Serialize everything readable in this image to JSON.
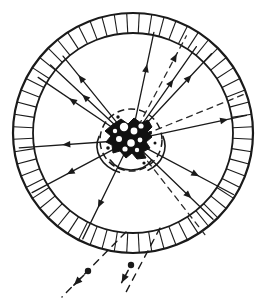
{
  "figure": {
    "name": "radial-emission-ring-diagram",
    "type": "scientific-line-diagram",
    "caption": "",
    "background_color": "#ffffff",
    "ink_color": "#1a1a1a",
    "width": 269,
    "height": 308
  },
  "ring": {
    "label": "hatched-annulus",
    "center_x": 133,
    "center_y": 133,
    "outer_radius": 120,
    "inner_radius": 100,
    "tick_count": 60,
    "stroke_width_outer": 2.2,
    "stroke_width_inner": 1.8,
    "tick_stroke_width": 1.1
  },
  "core": {
    "label": "central-dark-body",
    "center_x": 131,
    "center_y": 140,
    "fill_color": "#111111",
    "outline_radius": 31,
    "outline_dash": "7 4"
  },
  "rays": {
    "solid_label": "solid-ray",
    "dashed_label": "dashed-ray",
    "solid_color": "#1a1a1a",
    "dashed_color": "#2a2a2a",
    "solid_width": 1.3,
    "dashed_width": 1.3,
    "dash_pattern": "6 5",
    "solid": [
      {
        "id": "ray-nw-1",
        "angle_deg": 214,
        "length": 112,
        "head_at": 0.62
      },
      {
        "id": "ray-nw-2",
        "angle_deg": 223,
        "length": 110,
        "head_at": 0.55
      },
      {
        "id": "ray-nw-3",
        "angle_deg": 231,
        "length": 108,
        "head_at": 0.74
      },
      {
        "id": "ray-n-1",
        "angle_deg": 282,
        "length": 110,
        "head_at": 0.66
      },
      {
        "id": "ray-ne-1",
        "angle_deg": 305,
        "length": 114,
        "head_at": 0.6
      },
      {
        "id": "ray-ne-2",
        "angle_deg": 313,
        "length": 118,
        "head_at": 0.72
      },
      {
        "id": "ray-e-1",
        "angle_deg": 348,
        "length": 118,
        "head_at": 0.82
      },
      {
        "id": "ray-w-1",
        "angle_deg": 176,
        "length": 112,
        "head_at": 0.56
      },
      {
        "id": "ray-sw-1",
        "angle_deg": 152,
        "length": 112,
        "head_at": 0.6
      },
      {
        "id": "ray-sw-2",
        "angle_deg": 116,
        "length": 110,
        "head_at": 0.64
      },
      {
        "id": "ray-se-1",
        "angle_deg": 28,
        "length": 116,
        "head_at": 0.62
      },
      {
        "id": "ray-se-2",
        "angle_deg": 44,
        "length": 114,
        "head_at": 0.7
      }
    ],
    "dashed": [
      {
        "id": "dashed-ray-ne",
        "angle_deg": 298,
        "length": 118,
        "head_at": 0.8
      },
      {
        "id": "dashed-ray-e",
        "angle_deg": 338,
        "length": 122,
        "head_at": 0.0
      },
      {
        "id": "dashed-ray-se",
        "angle_deg": 52,
        "length": 120,
        "head_at": 0.0
      }
    ]
  },
  "escape_tracks": {
    "label": "dashed-escape-trajectory",
    "dash_pattern": "7 6",
    "stroke_width": 1.4,
    "dot_radius": 3.2,
    "tracks": [
      {
        "id": "escape-track-left",
        "start_x": 126,
        "start_y": 232,
        "end_x": 62,
        "end_y": 297,
        "dot_x": 88,
        "dot_y": 271,
        "arrow_angle_deg": 135
      },
      {
        "id": "escape-track-right",
        "start_x": 160,
        "start_y": 228,
        "end_x": 124,
        "end_y": 296,
        "dot_x": 131,
        "dot_y": 265,
        "arrow_angle_deg": 118
      }
    ]
  },
  "inner_arcs": {
    "label": "core-surrounding-arc",
    "stroke_width": 1.6,
    "arcs": [
      {
        "id": "arc-left-outer",
        "cx": 131,
        "cy": 146,
        "rx": 34,
        "ry": 28,
        "start_deg": 110,
        "end_deg": 200
      },
      {
        "id": "arc-right-outer",
        "cx": 131,
        "cy": 146,
        "rx": 34,
        "ry": 28,
        "start_deg": 340,
        "end_deg": 60
      },
      {
        "id": "arc-bottom",
        "cx": 131,
        "cy": 150,
        "rx": 24,
        "ry": 20,
        "start_deg": 30,
        "end_deg": 150
      }
    ]
  }
}
